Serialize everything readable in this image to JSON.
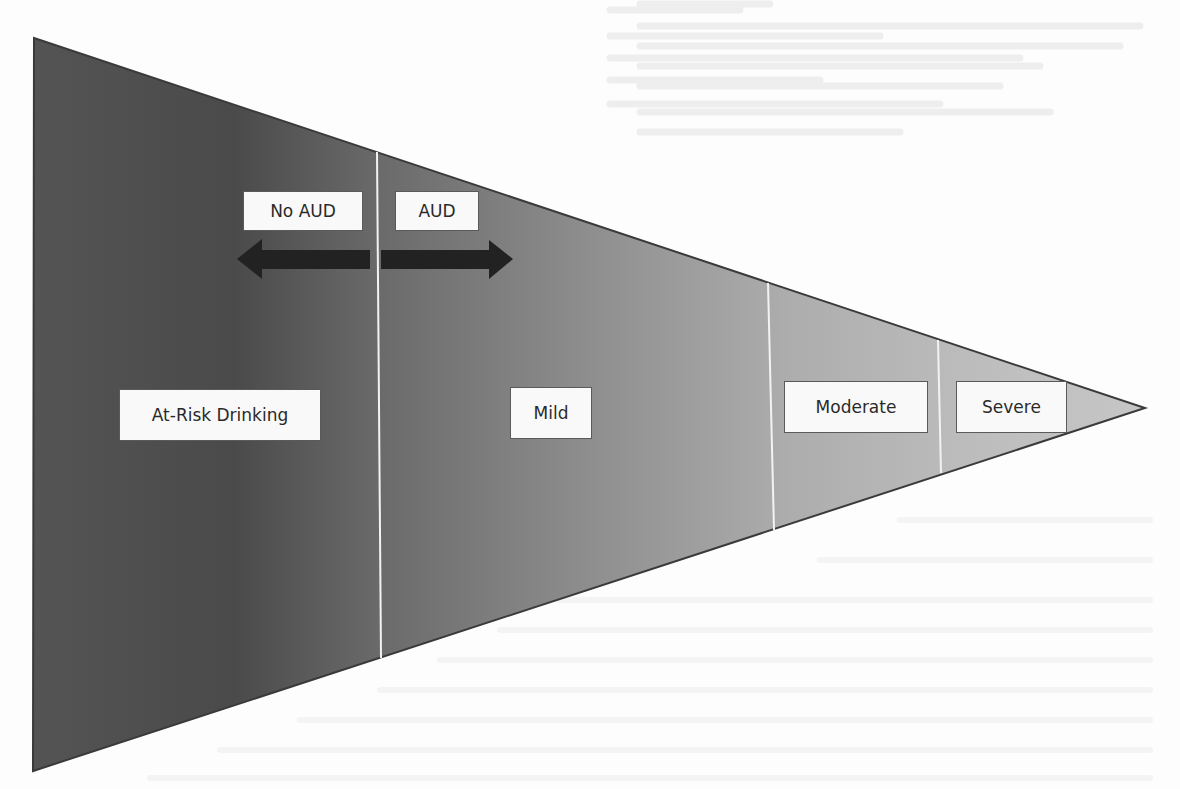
{
  "diagram": {
    "title": "",
    "shape": "horizontal-funnel-triangle",
    "gradient": {
      "left_color": "#555555",
      "right_color": "#c4c4c4"
    },
    "outline_color": "#3a3a3a",
    "divider_color": "#f2f2f2",
    "threshold_labels": {
      "left": "No AUD",
      "right": "AUD"
    },
    "threshold_arrow": {
      "direction": "bidirectional",
      "color": "#222222"
    },
    "segments": [
      {
        "label": "At-Risk Drinking"
      },
      {
        "label": "Mild"
      },
      {
        "label": "Moderate"
      },
      {
        "label": "Severe"
      }
    ]
  }
}
